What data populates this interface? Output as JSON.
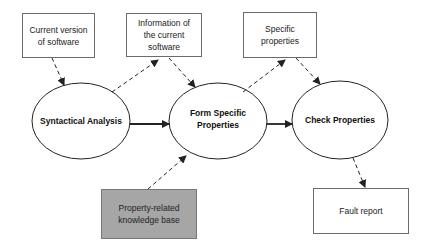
{
  "diagram": {
    "colors": {
      "stroke": "#222222",
      "box_border": "#6b6b6b",
      "knowledge_fill": "#a6a6a6",
      "background": "#ffffff"
    },
    "boxes": [
      {
        "id": "current_version",
        "label": "Current version of software",
        "x": 22,
        "y": 13,
        "w": 73,
        "h": 45
      },
      {
        "id": "info_software",
        "label": "Information of the current software",
        "x": 126,
        "y": 13,
        "w": 76,
        "h": 44
      },
      {
        "id": "specific_props",
        "label": "Specific properties",
        "x": 243,
        "y": 12,
        "w": 74,
        "h": 46
      },
      {
        "id": "knowledge_base",
        "label": "Property-related knowledge base",
        "x": 101,
        "y": 189,
        "w": 96,
        "h": 50,
        "fill": "gray"
      },
      {
        "id": "fault_report",
        "label": "Fault report",
        "x": 313,
        "y": 188,
        "w": 96,
        "h": 46
      }
    ],
    "ellipses": [
      {
        "id": "syntactical",
        "label": "Syntactical Analysis",
        "cx": 81,
        "cy": 121,
        "rx": 49,
        "ry": 38
      },
      {
        "id": "form_specific",
        "label": "Form Specific Properties",
        "cx": 218,
        "cy": 121,
        "rx": 49,
        "ry": 38
      },
      {
        "id": "check_props",
        "label": "Check Properties",
        "cx": 340,
        "cy": 120,
        "rx": 48,
        "ry": 39
      }
    ],
    "edges": [
      {
        "from": "current_version",
        "to": "syntactical",
        "style": "dashed"
      },
      {
        "from": "syntactical",
        "to": "info_software",
        "style": "dashed"
      },
      {
        "from": "info_software",
        "to": "form_specific",
        "style": "dashed"
      },
      {
        "from": "syntactical",
        "to": "form_specific",
        "style": "solid"
      },
      {
        "from": "form_specific",
        "to": "specific_props",
        "style": "dashed"
      },
      {
        "from": "specific_props",
        "to": "check_props",
        "style": "dashed"
      },
      {
        "from": "form_specific",
        "to": "check_props",
        "style": "solid"
      },
      {
        "from": "knowledge_base",
        "to": "form_specific",
        "style": "dashed"
      },
      {
        "from": "check_props",
        "to": "fault_report",
        "style": "dashed"
      }
    ]
  }
}
